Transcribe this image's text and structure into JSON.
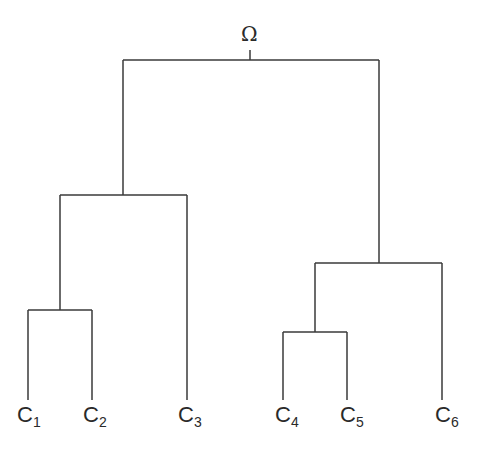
{
  "diagram": {
    "type": "dendrogram",
    "root_label": "Ω",
    "leaves": [
      {
        "base": "C",
        "sub": "1"
      },
      {
        "base": "C",
        "sub": "2"
      },
      {
        "base": "C",
        "sub": "3"
      },
      {
        "base": "C",
        "sub": "4"
      },
      {
        "base": "C",
        "sub": "5"
      },
      {
        "base": "C",
        "sub": "6"
      }
    ],
    "merges": [
      {
        "children": [
          "C1",
          "C2"
        ]
      },
      {
        "children": [
          "C1C2",
          "C3"
        ]
      },
      {
        "children": [
          "C4",
          "C5"
        ]
      },
      {
        "children": [
          "C4C5",
          "C6"
        ]
      },
      {
        "children": [
          "C1C2C3",
          "C4C5C6"
        ],
        "label": "Ω"
      }
    ],
    "line_color": "#3a3a3a"
  }
}
